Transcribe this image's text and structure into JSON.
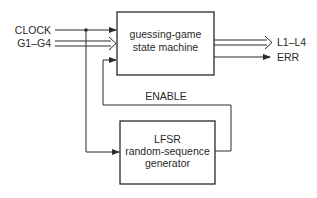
{
  "diagram": {
    "inputs": {
      "clock": "CLOCK",
      "guesses": "G1–G4"
    },
    "state_machine": {
      "line1": "guessing-game",
      "line2": "state machine"
    },
    "outputs": {
      "lights": "L1–L4",
      "error": "ERR"
    },
    "feedback_label": "ENABLE",
    "lfsr": {
      "line1": "LFSR",
      "line2": "random-sequence",
      "line3": "generator"
    }
  }
}
